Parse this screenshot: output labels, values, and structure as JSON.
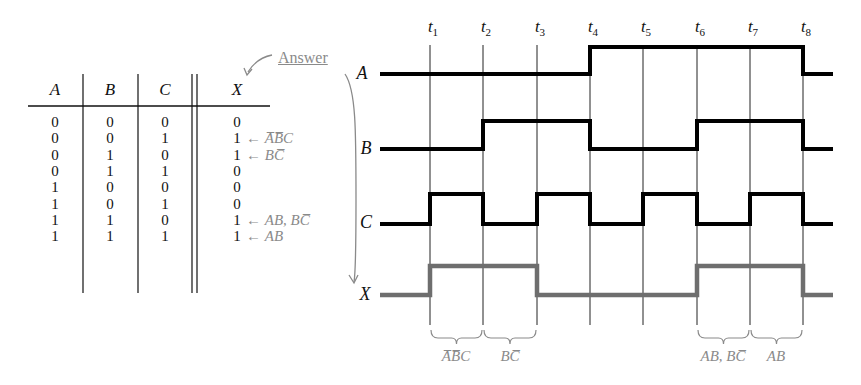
{
  "truth_table": {
    "headers": [
      "A",
      "B",
      "C",
      "X"
    ],
    "rows": [
      {
        "A": "0",
        "B": "0",
        "C": "0",
        "X": "0",
        "note": ""
      },
      {
        "A": "0",
        "B": "0",
        "C": "1",
        "X": "1",
        "note": "A̅B̅C"
      },
      {
        "A": "0",
        "B": "1",
        "C": "0",
        "X": "1",
        "note": "BC̅"
      },
      {
        "A": "0",
        "B": "1",
        "C": "1",
        "X": "0",
        "note": ""
      },
      {
        "A": "1",
        "B": "0",
        "C": "0",
        "X": "0",
        "note": ""
      },
      {
        "A": "1",
        "B": "0",
        "C": "1",
        "X": "0",
        "note": ""
      },
      {
        "A": "1",
        "B": "1",
        "C": "0",
        "X": "1",
        "note": "AB, BC̅"
      },
      {
        "A": "1",
        "B": "1",
        "C": "1",
        "X": "1",
        "note": "AB"
      }
    ],
    "arrow_glyph": "←"
  },
  "answer_label": "Answer",
  "timing": {
    "time_labels": [
      {
        "base": "t",
        "sub": "1"
      },
      {
        "base": "t",
        "sub": "2"
      },
      {
        "base": "t",
        "sub": "3"
      },
      {
        "base": "t",
        "sub": "4"
      },
      {
        "base": "t",
        "sub": "5"
      },
      {
        "base": "t",
        "sub": "6"
      },
      {
        "base": "t",
        "sub": "7"
      },
      {
        "base": "t",
        "sub": "8"
      }
    ],
    "signals": [
      {
        "name": "A",
        "levels": [
          0,
          0,
          0,
          0,
          1,
          1,
          1,
          1,
          0
        ],
        "color": "#000000"
      },
      {
        "name": "B",
        "levels": [
          0,
          0,
          1,
          1,
          0,
          0,
          1,
          1,
          0
        ],
        "color": "#000000"
      },
      {
        "name": "C",
        "levels": [
          0,
          1,
          0,
          1,
          0,
          1,
          0,
          1,
          0
        ],
        "color": "#000000"
      },
      {
        "name": "X",
        "levels": [
          0,
          1,
          1,
          0,
          0,
          0,
          1,
          1,
          0
        ],
        "color": "#6e6e6e"
      }
    ],
    "brace_labels": [
      {
        "text": "A̅B̅C",
        "from": "t1",
        "to": "t2"
      },
      {
        "text": "BC̅",
        "from": "t2",
        "to": "t3"
      },
      {
        "text": "AB, BC̅",
        "from": "t6",
        "to": "t7"
      },
      {
        "text": "AB",
        "from": "t7",
        "to": "t8"
      }
    ]
  },
  "colors": {
    "annotation_gray": "#8a8a8a",
    "output_wave_gray": "#6e6e6e",
    "ink": "#111111"
  }
}
